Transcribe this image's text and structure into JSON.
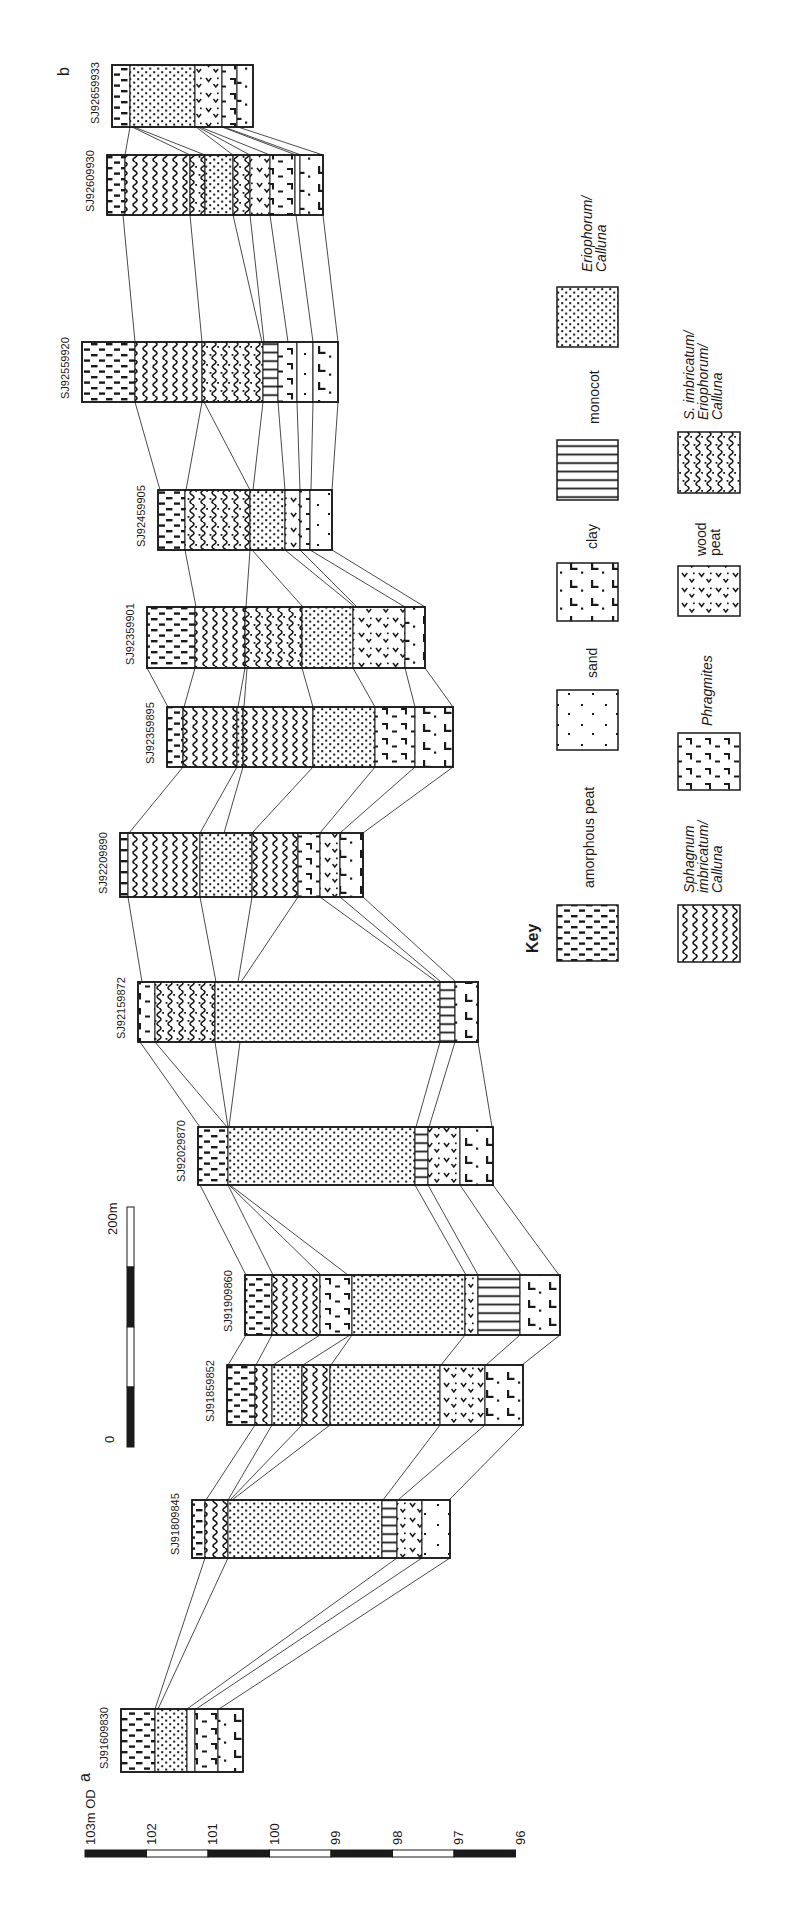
{
  "figure": {
    "panel_top_letter": "b",
    "panel_bottom_letter": "a"
  },
  "colors": {
    "ink": "#1a1a1a",
    "line": "#2a2a2a",
    "bg": "#ffffff"
  },
  "materials": {
    "am": {
      "name": "amorphous peat"
    },
    "sa": {
      "name": "sand"
    },
    "cl": {
      "name": "clay"
    },
    "mo": {
      "name": "monocot"
    },
    "eo": {
      "name": "Eriophorum/Calluna"
    },
    "sp": {
      "name": "Sphagnum imbricatum/Calluna"
    },
    "ph": {
      "name": "Phragmites"
    },
    "wd": {
      "name": "wood peat"
    },
    "se": {
      "name": "S. imbricatum/Eriophorum/Calluna"
    },
    "wh": {
      "name": "unmarked"
    }
  },
  "cores": [
    {
      "label": "SJ92659933",
      "x": 112,
      "y": 65,
      "h": 62,
      "bounds": [
        112,
        130,
        195,
        222,
        237,
        253
      ],
      "mats": [
        "am",
        "eo",
        "wd",
        "ph",
        "cl"
      ]
    },
    {
      "label": "SJ92609930",
      "x": 107,
      "y": 155,
      "h": 60,
      "bounds": [
        107,
        125,
        190,
        205,
        233,
        250,
        270,
        295,
        300,
        323
      ],
      "mats": [
        "am",
        "sp",
        "se",
        "eo",
        "se",
        "wd",
        "ph",
        "wh",
        "cl"
      ]
    },
    {
      "label": "SJ92559920",
      "x": 82,
      "y": 342,
      "h": 60,
      "bounds": [
        82,
        135,
        202,
        263,
        278,
        297,
        313,
        338
      ],
      "mats": [
        "am",
        "sp",
        "se",
        "mo",
        "ph",
        "sa",
        "cl"
      ]
    },
    {
      "label": "SJ92459905",
      "x": 158,
      "y": 490,
      "h": 60,
      "bounds": [
        158,
        185,
        250,
        285,
        300,
        310,
        332
      ],
      "mats": [
        "am",
        "se",
        "eo",
        "wd",
        "ph",
        "sa"
      ]
    },
    {
      "label": "SJ92359901",
      "x": 147,
      "y": 607,
      "h": 61,
      "bounds": [
        147,
        195,
        245,
        302,
        353,
        405,
        425
      ],
      "mats": [
        "am",
        "sp",
        "se",
        "eo",
        "wd",
        "cl"
      ]
    },
    {
      "label": "SJ92359895",
      "x": 167,
      "y": 707,
      "h": 60,
      "bounds": [
        167,
        183,
        237,
        243,
        313,
        375,
        415,
        453
      ],
      "mats": [
        "am",
        "sp",
        "eo",
        "sp",
        "eo",
        "ph",
        "cl"
      ]
    },
    {
      "label": "SJ92209890",
      "x": 120,
      "y": 833,
      "h": 64,
      "bounds": [
        120,
        128,
        200,
        252,
        298,
        320,
        340,
        363
      ],
      "mats": [
        "am",
        "sp",
        "eo",
        "sp",
        "ph",
        "wd",
        "cl"
      ]
    },
    {
      "label": "SJ92159872",
      "x": 138,
      "y": 982,
      "h": 60,
      "bounds": [
        138,
        155,
        215,
        440,
        455,
        478
      ],
      "mats": [
        "ph",
        "se",
        "eo",
        "mo",
        "cl"
      ]
    },
    {
      "label": "SJ92029870",
      "x": 198,
      "y": 1127,
      "h": 58,
      "bounds": [
        198,
        228,
        415,
        428,
        460,
        493
      ],
      "mats": [
        "am",
        "eo",
        "mo",
        "wd",
        "cl"
      ]
    },
    {
      "label": "SJ91909860",
      "x": 245,
      "y": 1275,
      "h": 60,
      "bounds": [
        245,
        272,
        320,
        352,
        465,
        478,
        520,
        560
      ],
      "mats": [
        "am",
        "sp",
        "ph",
        "eo",
        "wd",
        "mo",
        "cl"
      ]
    },
    {
      "label": "SJ91859852",
      "x": 227,
      "y": 1365,
      "h": 60,
      "bounds": [
        227,
        255,
        272,
        302,
        330,
        440,
        485,
        523
      ],
      "mats": [
        "am",
        "sp",
        "eo",
        "sp",
        "eo",
        "wd",
        "cl"
      ]
    },
    {
      "label": "SJ91809845",
      "x": 192,
      "y": 1500,
      "h": 58,
      "bounds": [
        192,
        205,
        228,
        382,
        397,
        422,
        450
      ],
      "mats": [
        "am",
        "sp",
        "eo",
        "mo",
        "wd",
        "sa"
      ]
    },
    {
      "label": "SJ91609830",
      "x": 121,
      "y": 1709,
      "h": 63,
      "bounds": [
        121,
        155,
        187,
        195,
        218,
        243
      ],
      "mats": [
        "am",
        "eo",
        "wh",
        "ph",
        "cl"
      ]
    }
  ],
  "key": {
    "title": "Key",
    "title_x": 538,
    "title_y": 953,
    "columns": [
      {
        "x": 557,
        "w": 61,
        "items": [
          {
            "mat": "eo",
            "lines": [
              "Eriophorum/",
              "Calluna"
            ],
            "italic": true,
            "lx": 592,
            "ly": 272,
            "sy": 287,
            "sh": 60
          },
          {
            "mat": "mo",
            "lines": [
              "monocot"
            ],
            "italic": false,
            "lx": 599,
            "ly": 424,
            "sy": 440,
            "sh": 60
          },
          {
            "mat": "cl",
            "lines": [
              "clay"
            ],
            "italic": false,
            "lx": 597,
            "ly": 549,
            "sy": 563,
            "sh": 58
          },
          {
            "mat": "sa",
            "lines": [
              "sand"
            ],
            "italic": false,
            "lx": 597,
            "ly": 678,
            "sy": 690,
            "sh": 60
          },
          {
            "mat": "am",
            "lines": [
              "amorphous peat"
            ],
            "italic": false,
            "lx": 594,
            "ly": 888,
            "sy": 905,
            "sh": 56
          }
        ]
      },
      {
        "x": 678,
        "w": 62,
        "items": [
          {
            "mat": "se",
            "lines": [
              "S. imbricatum/",
              "Eriophorum/",
              "Calluna"
            ],
            "italic": true,
            "lx": 694,
            "ly": 420,
            "sy": 432,
            "sh": 61
          },
          {
            "mat": "wd",
            "lines": [
              "wood",
              "peat"
            ],
            "italic": false,
            "lx": 706,
            "ly": 556,
            "sy": 566,
            "sh": 50
          },
          {
            "mat": "ph",
            "lines": [
              "Phragmites"
            ],
            "italic": true,
            "lx": 712,
            "ly": 726,
            "sy": 733,
            "sh": 57
          },
          {
            "mat": "sp",
            "lines": [
              "Sphagnum",
              "imbricatum/",
              "Calluna"
            ],
            "italic": true,
            "lx": 694,
            "ly": 893,
            "sy": 905,
            "sh": 57
          }
        ]
      }
    ]
  },
  "elevation_scale": {
    "label": "103m OD",
    "label_x": 95,
    "label_y": 1845,
    "x0": 85,
    "step": 61.5,
    "y": 1850,
    "h": 7,
    "ticks": [
      "102",
      "101",
      "100",
      "99",
      "98",
      "97",
      "96"
    ]
  },
  "distance_scale": {
    "top_label": "200m",
    "zero_label": "0",
    "x": 127,
    "w": 7,
    "y0": 1207,
    "block": 60,
    "blocks": 4,
    "top_label_x": 117,
    "top_label_y": 1235,
    "zero_label_x": 114,
    "zero_label_y": 1443
  },
  "connectors": [
    [
      130,
      127,
      125,
      155
    ],
    [
      132,
      127,
      190,
      155
    ],
    [
      134,
      127,
      205,
      155
    ],
    [
      196,
      127,
      233,
      155
    ],
    [
      198,
      127,
      250,
      155
    ],
    [
      200,
      127,
      270,
      155
    ],
    [
      222,
      127,
      296,
      155
    ],
    [
      224,
      127,
      301,
      155
    ],
    [
      238,
      127,
      323,
      155
    ],
    [
      123,
      215,
      135,
      342
    ],
    [
      190,
      215,
      202,
      342
    ],
    [
      233,
      215,
      262,
      342
    ],
    [
      250,
      215,
      264,
      342
    ],
    [
      270,
      215,
      288,
      342
    ],
    [
      296,
      215,
      313,
      342
    ],
    [
      323,
      215,
      338,
      342
    ],
    [
      135,
      402,
      160,
      490
    ],
    [
      202,
      402,
      186,
      490
    ],
    [
      204,
      402,
      250,
      490
    ],
    [
      263,
      402,
      253,
      490
    ],
    [
      278,
      402,
      285,
      490
    ],
    [
      297,
      402,
      300,
      490
    ],
    [
      313,
      402,
      311,
      490
    ],
    [
      338,
      402,
      332,
      490
    ],
    [
      185,
      550,
      196,
      607
    ],
    [
      250,
      550,
      246,
      607
    ],
    [
      252,
      550,
      303,
      607
    ],
    [
      285,
      550,
      355,
      607
    ],
    [
      300,
      550,
      357,
      607
    ],
    [
      310,
      550,
      405,
      607
    ],
    [
      332,
      550,
      425,
      607
    ],
    [
      147,
      668,
      168,
      707
    ],
    [
      195,
      668,
      184,
      707
    ],
    [
      245,
      668,
      238,
      707
    ],
    [
      247,
      668,
      244,
      707
    ],
    [
      302,
      668,
      313,
      707
    ],
    [
      353,
      668,
      375,
      707
    ],
    [
      405,
      668,
      415,
      707
    ],
    [
      425,
      668,
      453,
      707
    ],
    [
      183,
      767,
      129,
      833
    ],
    [
      237,
      767,
      200,
      833
    ],
    [
      243,
      767,
      224,
      833
    ],
    [
      313,
      767,
      252,
      833
    ],
    [
      375,
      767,
      320,
      833
    ],
    [
      415,
      767,
      340,
      833
    ],
    [
      453,
      767,
      363,
      833
    ],
    [
      128,
      897,
      142,
      982
    ],
    [
      200,
      897,
      216,
      982
    ],
    [
      252,
      897,
      238,
      982
    ],
    [
      298,
      897,
      241,
      982
    ],
    [
      320,
      897,
      437,
      982
    ],
    [
      340,
      897,
      441,
      982
    ],
    [
      363,
      897,
      456,
      982
    ],
    [
      140,
      1042,
      200,
      1127
    ],
    [
      155,
      1042,
      227,
      1127
    ],
    [
      215,
      1042,
      228,
      1127
    ],
    [
      240,
      1042,
      229,
      1127
    ],
    [
      440,
      1042,
      416,
      1127
    ],
    [
      455,
      1042,
      429,
      1127
    ],
    [
      478,
      1042,
      492,
      1127
    ],
    [
      200,
      1185,
      246,
      1275
    ],
    [
      228,
      1185,
      273,
      1275
    ],
    [
      229,
      1185,
      321,
      1275
    ],
    [
      230,
      1185,
      348,
      1275
    ],
    [
      415,
      1185,
      466,
      1275
    ],
    [
      428,
      1185,
      478,
      1275
    ],
    [
      460,
      1185,
      521,
      1275
    ],
    [
      493,
      1185,
      559,
      1275
    ],
    [
      246,
      1335,
      228,
      1365
    ],
    [
      272,
      1335,
      256,
      1365
    ],
    [
      320,
      1335,
      273,
      1365
    ],
    [
      350,
      1335,
      303,
      1365
    ],
    [
      352,
      1335,
      331,
      1365
    ],
    [
      465,
      1335,
      441,
      1365
    ],
    [
      520,
      1335,
      486,
      1365
    ],
    [
      560,
      1335,
      522,
      1365
    ],
    [
      255,
      1425,
      206,
      1500
    ],
    [
      272,
      1425,
      228,
      1500
    ],
    [
      302,
      1425,
      230,
      1500
    ],
    [
      330,
      1425,
      232,
      1500
    ],
    [
      440,
      1425,
      383,
      1500
    ],
    [
      485,
      1425,
      398,
      1500
    ],
    [
      523,
      1425,
      449,
      1500
    ],
    [
      205,
      1558,
      155,
      1709
    ],
    [
      228,
      1558,
      158,
      1709
    ],
    [
      397,
      1558,
      187,
      1709
    ],
    [
      422,
      1558,
      196,
      1709
    ],
    [
      450,
      1558,
      219,
      1709
    ]
  ],
  "panel_letters": {
    "b_x": 69,
    "b_y": 76,
    "a_x": 90,
    "a_y": 1782
  }
}
